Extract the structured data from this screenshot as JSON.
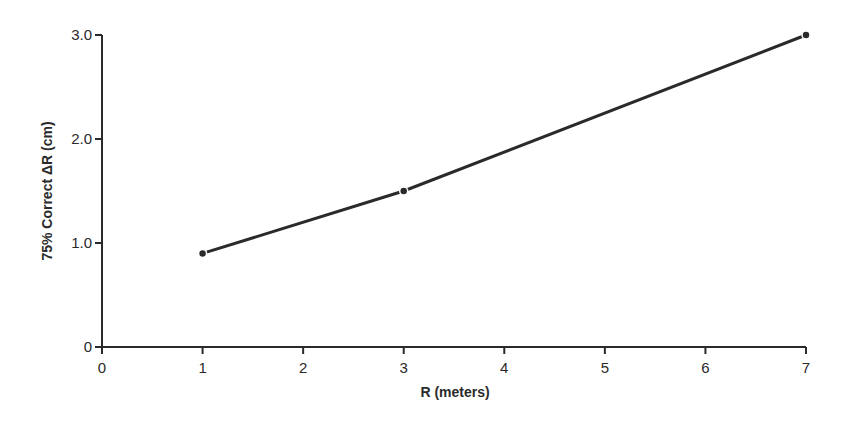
{
  "chart_data": {
    "type": "line",
    "title": "",
    "xlabel": "R (meters)",
    "ylabel": "75% Correct ΔR (cm)",
    "x": [
      1,
      3,
      7
    ],
    "values": [
      0.9,
      1.5,
      3.0
    ],
    "series": [
      {
        "name": "75% Correct ΔR",
        "x": [
          1,
          3,
          7
        ],
        "values": [
          0.9,
          1.5,
          3.0
        ]
      }
    ],
    "xlim": [
      0,
      7
    ],
    "ylim": [
      0,
      3.0
    ],
    "x_ticks": [
      "0",
      "1",
      "2",
      "3",
      "4",
      "5",
      "6",
      "7"
    ],
    "y_ticks": [
      "0",
      "1.0",
      "2.0",
      "3.0"
    ],
    "grid": false,
    "legend": "none",
    "markers": "filled-circle",
    "colors": {
      "line": "#2a2a2a",
      "axis": "#2a2a2a",
      "background": "#ffffff"
    }
  }
}
